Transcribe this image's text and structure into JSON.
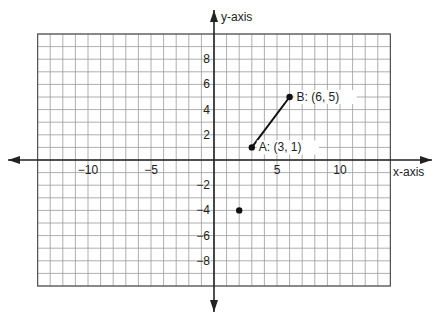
{
  "chart_data": {
    "type": "scatter",
    "title": "",
    "xlabel": "x-axis",
    "ylabel": "y-axis",
    "xlim": [
      -14,
      14
    ],
    "ylim": [
      -10,
      10
    ],
    "grid": true,
    "x_ticks": [
      -10,
      -5,
      5,
      10
    ],
    "y_ticks": [
      8,
      6,
      4,
      2,
      -2,
      -4,
      -6,
      -8
    ],
    "points": [
      {
        "name": "A",
        "x": 3,
        "y": 1,
        "label": "A: (3, 1)"
      },
      {
        "name": "B",
        "x": 6,
        "y": 5,
        "label": "B: (6, 5)"
      },
      {
        "name": "",
        "x": 2,
        "y": -4,
        "label": ""
      }
    ],
    "segments": [
      {
        "from": "A",
        "to": "B"
      }
    ]
  },
  "colors": {
    "grid": "#9a9a9a",
    "axis": "#222222",
    "point": "#111111",
    "background": "#ffffff"
  }
}
